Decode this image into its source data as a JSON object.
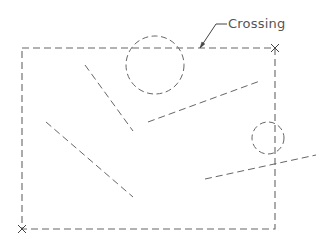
{
  "diagram": {
    "stroke_color": "#666666",
    "background": "#ffffff",
    "dash_pattern": "7,4",
    "annotation": {
      "text": "Crossing",
      "x": 228,
      "y": 17,
      "leader": {
        "tip": [
          200,
          48
        ],
        "elbow": [
          216,
          24
        ],
        "end": [
          227,
          24
        ]
      }
    },
    "selection_window": {
      "type": "crossing",
      "x1": 22,
      "y1": 48,
      "x2": 275,
      "y2": 229,
      "corner_markers": [
        {
          "name": "top-right",
          "x": 275,
          "y": 48
        },
        {
          "name": "bottom-left",
          "x": 22,
          "y": 229
        }
      ]
    },
    "circles": [
      {
        "name": "large-circle",
        "cx": 155,
        "cy": 65,
        "r": 29
      },
      {
        "name": "small-circle",
        "cx": 268,
        "cy": 138,
        "r": 16
      }
    ],
    "lines": [
      {
        "name": "line-1",
        "x1": 85,
        "y1": 65,
        "x2": 133,
        "y2": 131
      },
      {
        "name": "line-2",
        "x1": 46,
        "y1": 122,
        "x2": 133,
        "y2": 197
      },
      {
        "name": "line-3",
        "x1": 148,
        "y1": 122,
        "x2": 260,
        "y2": 81
      },
      {
        "name": "line-4",
        "x1": 205,
        "y1": 179,
        "x2": 316,
        "y2": 155
      }
    ]
  }
}
